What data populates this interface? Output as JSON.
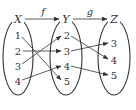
{
  "sets": {
    "X": {
      "label": "X",
      "elements": [
        "1",
        "2",
        "3",
        "4"
      ]
    },
    "Y": {
      "label": "Y",
      "elements": [
        "2",
        "3",
        "4",
        "5"
      ]
    },
    "Z": {
      "label": "Z",
      "elements": [
        "3",
        "4",
        "5"
      ]
    }
  },
  "functions": {
    "f": {
      "label": "f",
      "from": "X",
      "to": "Y",
      "mapping": [
        [
          "1",
          "5"
        ],
        [
          "2",
          "3"
        ],
        [
          "3",
          "2"
        ],
        [
          "4",
          "4"
        ]
      ]
    },
    "g": {
      "label": "g",
      "from": "Y",
      "to": "Z",
      "mapping": [
        [
          "2",
          "4"
        ],
        [
          "3",
          "3"
        ],
        [
          "4",
          "5"
        ]
      ]
    }
  },
  "colors": {
    "stroke": "#333333",
    "background": "#ffffff"
  }
}
